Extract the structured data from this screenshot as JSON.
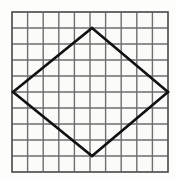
{
  "figure": {
    "canvas": {
      "width": 176,
      "height": 179,
      "background": "#fdfdfb"
    },
    "grid": {
      "columns": 10,
      "rows": 10,
      "x_start": 12,
      "y_start": 12,
      "x_end": 168,
      "y_end": 172,
      "cell_width": 15.6,
      "cell_height": 16.0,
      "line_color": "#6e6e6e",
      "line_width": 1.4,
      "border_color": "#5a5a5a",
      "border_width": 1.8,
      "cell_fill": "#fbfbf9"
    },
    "shape": {
      "name": "rhombus",
      "stroke_color": "#111111",
      "stroke_width": 2.6,
      "fill": "none",
      "vertices": [
        {
          "label": "top",
          "x": 92,
          "y": 28,
          "grid_col": 5,
          "grid_row": 1
        },
        {
          "label": "right",
          "x": 168,
          "y": 92,
          "grid_col": 10,
          "grid_row": 5
        },
        {
          "label": "bottom",
          "x": 92,
          "y": 156,
          "grid_col": 5,
          "grid_row": 9
        },
        {
          "label": "left",
          "x": 13,
          "y": 92,
          "grid_col": 0,
          "grid_row": 5
        }
      ],
      "diagonal_horizontal_cells": 10,
      "diagonal_vertical_cells": 8
    }
  }
}
